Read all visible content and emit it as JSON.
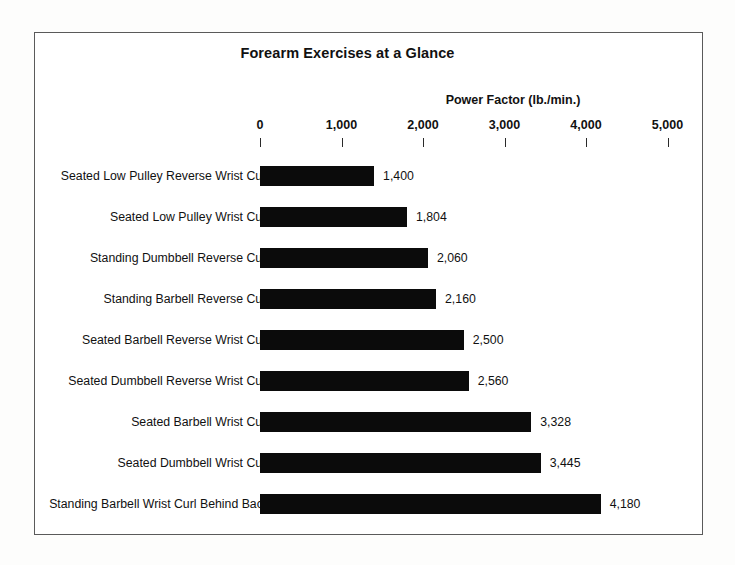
{
  "figure": {
    "frame_border_color": "#5a5a5a",
    "background_color": "#ffffff",
    "bar_color": "#0b0b0b",
    "text_color": "#111111"
  },
  "chart_data": {
    "type": "bar",
    "orientation": "horizontal",
    "title": "Forearm Exercises at a Glance",
    "xlabel": "Power Factor (lb./min.)",
    "ylabel": "",
    "xlim": [
      0,
      5000
    ],
    "grid": false,
    "legend": null,
    "xticks": [
      0,
      1000,
      2000,
      3000,
      4000,
      5000
    ],
    "xticklabels": [
      "0",
      "1,000",
      "2,000",
      "3,000",
      "4,000",
      "5,000"
    ],
    "categories": [
      "Seated Low Pulley Reverse Wrist Curl",
      "Seated Low Pulley Wrist Curl",
      "Standing Dumbbell Reverse Curl",
      "Standing Barbell Reverse Curl",
      "Seated Barbell Reverse Wrist Curl",
      "Seated Dumbbell Reverse Wrist Curl",
      "Seated Barbell Wrist Curl",
      "Seated Dumbbell Wrist Curl",
      "Standing Barbell Wrist Curl Behind Back"
    ],
    "values": [
      1400,
      1804,
      2060,
      2160,
      2500,
      2560,
      3328,
      3445,
      4180
    ],
    "value_labels": [
      "1,400",
      "1,804",
      "2,060",
      "2,160",
      "2,500",
      "2,560",
      "3,328",
      "3,445",
      "4,180"
    ]
  }
}
